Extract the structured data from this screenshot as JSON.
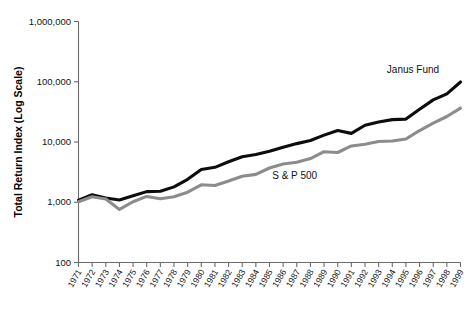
{
  "chart_data": {
    "type": "line",
    "title": "",
    "xlabel": "",
    "ylabel": "Total Return Index (Log Scale)",
    "y_scale": "log",
    "ylim": [
      100,
      1000000
    ],
    "grid": false,
    "legend_position": "inline-annotation",
    "ytick_labels": [
      "1,000,000",
      "100,000",
      "10,000",
      "1,000",
      "100"
    ],
    "ytick_values": [
      1000000,
      100000,
      10000,
      1000,
      100
    ],
    "categories": [
      "1971",
      "1972",
      "1973",
      "1974",
      "1975",
      "1976",
      "1977",
      "1978",
      "1979",
      "1980",
      "1981",
      "1982",
      "1983",
      "1984",
      "1985",
      "1986",
      "1987",
      "1988",
      "1989",
      "1990",
      "1991",
      "1992",
      "1993",
      "1994",
      "1995",
      "1996",
      "1997",
      "1998",
      "1999"
    ],
    "x": [
      1971,
      1972,
      1973,
      1974,
      1975,
      1976,
      1977,
      1978,
      1979,
      1980,
      1981,
      1982,
      1983,
      1984,
      1985,
      1986,
      1987,
      1988,
      1989,
      1990,
      1991,
      1992,
      1993,
      1994,
      1995,
      1996,
      1997,
      1998,
      1999
    ],
    "series": [
      {
        "name": "Janus Fund",
        "color": "#0d0d0d",
        "stroke_width": 3.1,
        "label_x": 1993.6,
        "label_y": 140000,
        "values": [
          1080,
          1330,
          1180,
          1090,
          1280,
          1500,
          1520,
          1800,
          2400,
          3500,
          3800,
          4700,
          5700,
          6200,
          7000,
          8200,
          9400,
          10600,
          13000,
          15500,
          13900,
          19000,
          21500,
          23500,
          24000,
          35000,
          50000,
          63000,
          99000
        ]
      },
      {
        "name": "S & P 500",
        "color": "#8c8c8c",
        "stroke_width": 3.1,
        "label_x": 1985.2,
        "label_y": 2450,
        "values": [
          1020,
          1230,
          1130,
          760,
          1020,
          1250,
          1140,
          1230,
          1470,
          1950,
          1900,
          2250,
          2700,
          2900,
          3700,
          4300,
          4600,
          5300,
          6900,
          6700,
          8600,
          9200,
          10200,
          10400,
          11200,
          15500,
          20500,
          26500,
          36500
        ]
      }
    ]
  },
  "axes": {
    "y_title": "Total Return Index (Log Scale)"
  }
}
